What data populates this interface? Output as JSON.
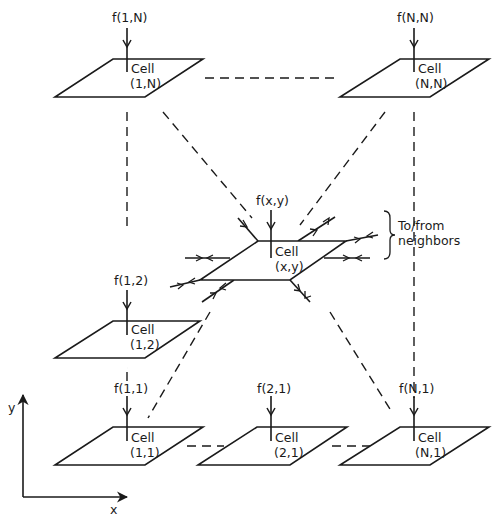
{
  "diagram": {
    "type": "cellular-grid-schematic",
    "colors": {
      "ink": "#1a1a1a",
      "background": "#ffffff"
    },
    "axes": {
      "x_label": "x",
      "y_label": "y"
    },
    "neighbor_note": "To/from neighbors",
    "cells": [
      {
        "id": "1N",
        "title": "Cell",
        "coord": "(1,N)",
        "input": "f(1,N)"
      },
      {
        "id": "NN",
        "title": "Cell",
        "coord": "(N,N)",
        "input": "f(N,N)"
      },
      {
        "id": "xy",
        "title": "Cell",
        "coord": "(x,y)",
        "input": "f(x,y)"
      },
      {
        "id": "12",
        "title": "Cell",
        "coord": "(1,2)",
        "input": "f(1,2)"
      },
      {
        "id": "11",
        "title": "Cell",
        "coord": "(1,1)",
        "input": "f(1,1)"
      },
      {
        "id": "21",
        "title": "Cell",
        "coord": "(2,1)",
        "input": "f(2,1)"
      },
      {
        "id": "N1",
        "title": "Cell",
        "coord": "(N,1)",
        "input": "f(N,1)"
      }
    ],
    "connections": [
      "1N-NN dashed",
      "1N-12 dashed",
      "12-11 dashed",
      "11-21 dashed",
      "21-N1 dashed",
      "NN-N1 dashed",
      "1N-xy dashed",
      "NN-xy dashed",
      "xy-11 dashed",
      "xy-N1 dashed"
    ]
  }
}
